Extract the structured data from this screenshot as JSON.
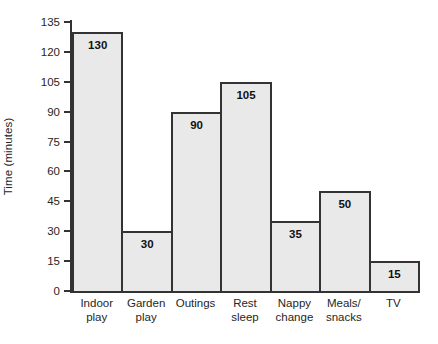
{
  "chart_data": {
    "type": "bar",
    "title": "",
    "xlabel": "",
    "ylabel": "Time (minutes)",
    "categories": [
      "Indoor play",
      "Garden play",
      "Outings",
      "Rest sleep",
      "Nappy change",
      "Meals/ snacks",
      "TV"
    ],
    "category_lines": [
      [
        "Indoor",
        "play"
      ],
      [
        "Garden",
        "play"
      ],
      [
        "Outings",
        ""
      ],
      [
        "Rest",
        "sleep"
      ],
      [
        "Nappy",
        "change"
      ],
      [
        "Meals/",
        "snacks"
      ],
      [
        "TV",
        ""
      ]
    ],
    "values": [
      130,
      30,
      90,
      105,
      35,
      50,
      15
    ],
    "value_labels": [
      "130",
      "30",
      "90",
      "105",
      "35",
      "50",
      "15"
    ],
    "ylim": [
      0,
      135
    ],
    "yticks": [
      0,
      15,
      30,
      45,
      60,
      75,
      90,
      105,
      120,
      135
    ],
    "ytick_labels": [
      "0",
      "15",
      "30",
      "45",
      "60",
      "75",
      "90",
      "105",
      "120",
      "135"
    ],
    "grid": false,
    "legend": false,
    "bar_fill_color": "#e9e9e9",
    "bar_edge_color": "#333333",
    "axis_color": "#333333",
    "background_color": "#ffffff"
  }
}
